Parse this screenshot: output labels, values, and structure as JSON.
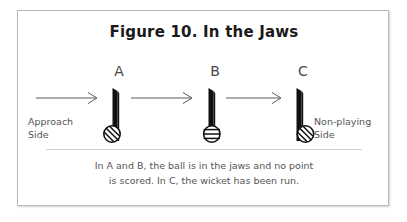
{
  "figure": {
    "title": "Figure 10. In the Jaws",
    "panels": [
      {
        "letter": "A",
        "name": "panel-a",
        "ball_position": "approach-side-of-wicket"
      },
      {
        "letter": "B",
        "name": "panel-b",
        "ball_position": "centered-in-jaws"
      },
      {
        "letter": "C",
        "name": "panel-c",
        "ball_position": "non-playing-side-of-wicket"
      }
    ],
    "arrows": [
      {
        "name": "approach-arrow-a",
        "direction": "right"
      },
      {
        "name": "approach-arrow-b",
        "direction": "right"
      },
      {
        "name": "approach-arrow-c",
        "direction": "right"
      }
    ],
    "side_labels": {
      "left_line1": "Approach",
      "left_line2": "Side",
      "right_line1": "Non-playing",
      "right_line2": "Side"
    },
    "caption": {
      "line1": "In A and B, the ball is in the jaws and no point",
      "line2": "is scored. In C, the wicket has been run."
    },
    "colors": {
      "ink": "#1a1a1a",
      "text_gray": "#555555",
      "border": "#b9b9b9",
      "ground_line": "#cfcfcf",
      "background": "#ffffff"
    }
  }
}
